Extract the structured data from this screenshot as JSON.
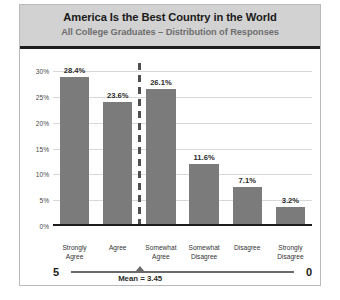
{
  "chart_data": {
    "type": "bar",
    "title": "America Is the Best Country in the World",
    "subtitle": "All College Graduates – Distribution of Responses",
    "categories": [
      "Strongly\nAgree",
      "Agree",
      "Somewhat\nAgree",
      "Somewhat\nDisagree",
      "Disagree",
      "Strongly\nDisagree"
    ],
    "values": [
      28.4,
      23.6,
      26.1,
      11.6,
      7.1,
      3.2
    ],
    "value_labels": [
      "28.4%",
      "23.6%",
      "26.1%",
      "11.6%",
      "7.1%",
      "3.2%"
    ],
    "xlabel": "",
    "ylabel": "",
    "ylim": [
      0,
      30
    ],
    "ytick_values": [
      0,
      5,
      10,
      15,
      20,
      25,
      30
    ],
    "ytick_labels": [
      "0%",
      "5%",
      "10%",
      "15%",
      "20%",
      "25%",
      "30%"
    ],
    "grid": true,
    "legend": false,
    "bar_color": "#7b7b7b",
    "annotations": {
      "divider": {
        "label": "",
        "after_category_index": 1,
        "style": "dashed-vertical"
      },
      "mean": {
        "label": "Mean = 3.45",
        "value": 3.45,
        "scale_max_label": "5",
        "scale_min_label": "0",
        "scale_max": 5,
        "scale_min": 0
      }
    }
  },
  "style": {
    "header_band_color": "#d2d2d2",
    "title_color": "#1a1a1a",
    "subtitle_color": "#6e6e6e",
    "gridline_color": "#d8d8d8",
    "baseline_color": "#1d1d1d",
    "frame_color": "#b9b9b9"
  }
}
